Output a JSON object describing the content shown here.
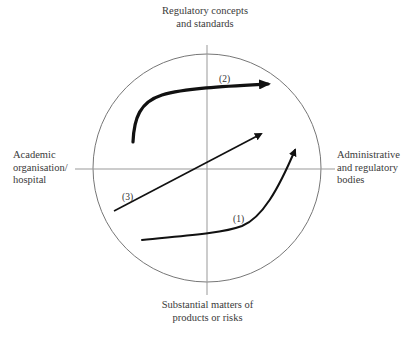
{
  "diagram": {
    "axes": {
      "top": "Regulatory concepts and standards",
      "top_lines": [
        "Regulatory concepts",
        "and standards"
      ],
      "bottom": "Substantial matters of products or risks",
      "bottom_lines": [
        "Substantial matters of",
        "products or risks"
      ],
      "left": "Academic organisation/ hospital",
      "left_lines": [
        "Academic",
        "organisation/",
        "hospital"
      ],
      "right": "Administrative and regulatory bodies",
      "right_lines": [
        "Administrative",
        "and regulatory",
        "bodies"
      ]
    },
    "arrows": [
      {
        "id": "1",
        "label": "(1)",
        "description": "curve from lower-left, flat then rising steeply to upper-right quadrant edge"
      },
      {
        "id": "2",
        "label": "(2)",
        "description": "thick curve rising from left then running right across the top"
      },
      {
        "id": "3",
        "label": "(3)",
        "description": "straight diagonal from lower-left to upper-right"
      }
    ],
    "colors": {
      "circle": "#777777",
      "axes": "#999999",
      "arrows": "#111111",
      "text": "#3a3a3a"
    }
  }
}
